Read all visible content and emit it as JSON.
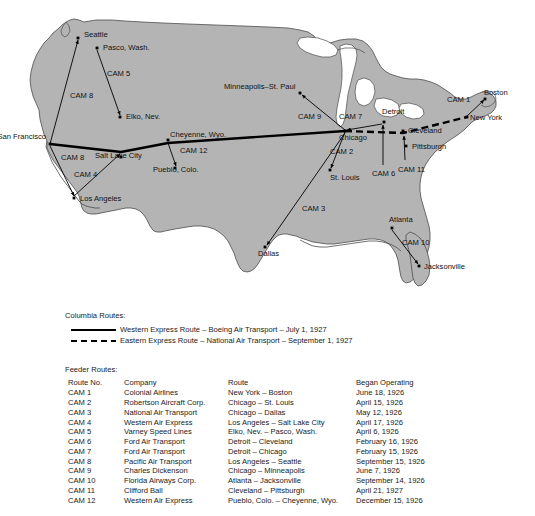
{
  "map": {
    "title": "U.S. Air Mail Routes Map",
    "land_color": "#b4b4b4",
    "water_color": "#ffffff",
    "outline_color": "#4d4d4d",
    "route_color": "#000000",
    "cities": [
      {
        "name": "Seattle",
        "x": 78,
        "y": 38,
        "lx": 84,
        "ly": 37,
        "anchor": "start"
      },
      {
        "name": "Pasco, Wash.",
        "x": 97,
        "y": 48,
        "lx": 103,
        "ly": 50,
        "anchor": "start"
      },
      {
        "name": "Elko, Nev.",
        "x": 120,
        "y": 117,
        "lx": 126,
        "ly": 119,
        "anchor": "start"
      },
      {
        "name": "San Francisco",
        "x": 50,
        "y": 144,
        "lx": 46,
        "ly": 139,
        "anchor": "end"
      },
      {
        "name": "Los Angeles",
        "x": 74,
        "y": 198,
        "lx": 80,
        "ly": 201,
        "anchor": "start"
      },
      {
        "name": "Salt Lake City",
        "x": 121,
        "y": 157,
        "lx": 95,
        "ly": 158,
        "anchor": "start"
      },
      {
        "name": "Cheyenne, Wyo.",
        "x": 168,
        "y": 140,
        "lx": 170,
        "ly": 137,
        "anchor": "start"
      },
      {
        "name": "Pueblo, Colo.",
        "x": 175,
        "y": 168,
        "lx": 153,
        "ly": 172,
        "anchor": "start"
      },
      {
        "name": "Minneapolis–St. Paul",
        "x": 300,
        "y": 93,
        "lx": 224,
        "ly": 89,
        "anchor": "start"
      },
      {
        "name": "Chicago",
        "x": 345,
        "y": 131,
        "lx": 339,
        "ly": 140,
        "anchor": "start"
      },
      {
        "name": "St. Louis",
        "x": 330,
        "y": 170,
        "lx": 330,
        "ly": 180,
        "anchor": "start"
      },
      {
        "name": "Detroit",
        "x": 384,
        "y": 122,
        "lx": 382,
        "ly": 114,
        "anchor": "start"
      },
      {
        "name": "Cleveland",
        "x": 403,
        "y": 131,
        "lx": 408,
        "ly": 133,
        "anchor": "start"
      },
      {
        "name": "Pittsburgh",
        "x": 406,
        "y": 146,
        "lx": 412,
        "ly": 149,
        "anchor": "start"
      },
      {
        "name": "New York",
        "x": 467,
        "y": 117,
        "lx": 470,
        "ly": 120,
        "anchor": "start"
      },
      {
        "name": "Boston",
        "x": 485,
        "y": 99,
        "lx": 484,
        "ly": 95,
        "anchor": "start"
      },
      {
        "name": "Dallas",
        "x": 265,
        "y": 247,
        "lx": 258,
        "ly": 256,
        "anchor": "start"
      },
      {
        "name": "Atlanta",
        "x": 392,
        "y": 228,
        "lx": 389,
        "ly": 222,
        "anchor": "start"
      },
      {
        "name": "Jacksonville",
        "x": 419,
        "y": 266,
        "lx": 424,
        "ly": 269,
        "anchor": "start"
      }
    ],
    "cam_labels": [
      {
        "name": "CAM 8",
        "x": 70,
        "y": 98
      },
      {
        "name": "CAM 5",
        "x": 107,
        "y": 76
      },
      {
        "name": "CAM 8",
        "x": 61,
        "y": 160
      },
      {
        "name": "CAM 4",
        "x": 74,
        "y": 177
      },
      {
        "name": "CAM 12",
        "x": 180,
        "y": 153
      },
      {
        "name": "CAM 9",
        "x": 298,
        "y": 119
      },
      {
        "name": "CAM 7",
        "x": 339,
        "y": 119
      },
      {
        "name": "CAM 2",
        "x": 330,
        "y": 154
      },
      {
        "name": "CAM 3",
        "x": 302,
        "y": 211
      },
      {
        "name": "CAM 6",
        "x": 372,
        "y": 176
      },
      {
        "name": "CAM 11",
        "x": 398,
        "y": 172
      },
      {
        "name": "CAM 1",
        "x": 447,
        "y": 102
      },
      {
        "name": "CAM 10",
        "x": 402,
        "y": 245
      }
    ]
  },
  "columbia_legend": {
    "title": "Columbia Routes:",
    "entries": [
      {
        "style": "solid",
        "label": "Western Express Route – Boeing Air Transport – July 1, 1927"
      },
      {
        "style": "dashed",
        "label": "Eastern Express Route – National Air Transport – September 1, 1927"
      }
    ]
  },
  "feeder_legend": {
    "title": "Feeder Routes:",
    "headers": {
      "route_no": "Route No.",
      "company": "Company",
      "route": "Route",
      "began": "Began Operating"
    },
    "rows": [
      {
        "no": "CAM 1",
        "company": "Colonial Airlines",
        "route": "New York – Boston",
        "began": "June 18, 1926"
      },
      {
        "no": "CAM 2",
        "company": "Robertson Aircraft Corp.",
        "route": "Chicago – St. Louis",
        "began": "April 15, 1926"
      },
      {
        "no": "CAM 3",
        "company": "National Air Transport",
        "route": "Chicago – Dallas",
        "began": "May 12, 1926"
      },
      {
        "no": "CAM 4",
        "company": "Western Air Express",
        "route": "Los Angeles – Salt Lake City",
        "began": "April 17, 1926"
      },
      {
        "no": "CAM 5",
        "company": "Varney Speed Lines",
        "route": "Elko, Nev. – Pasco, Wash.",
        "began": "April 6, 1926"
      },
      {
        "no": "CAM 6",
        "company": "Ford Air Transport",
        "route": "Detroit – Cleveland",
        "began": "February 16, 1926"
      },
      {
        "no": "CAM 7",
        "company": "Ford Air Transport",
        "route": "Detroit – Chicago",
        "began": "February 15, 1926"
      },
      {
        "no": "CAM 8",
        "company": "Pacific Air Transport",
        "route": "Los Angeles – Seattle",
        "began": "September 15, 1926"
      },
      {
        "no": "CAM 9",
        "company": "Charles Dickenson",
        "route": "Chicago – Minneapolis",
        "began": "June 7, 1926"
      },
      {
        "no": "CAM 10",
        "company": "Florida Airways Corp.",
        "route": "Atlanta – Jacksonville",
        "began": "September 14, 1926"
      },
      {
        "no": "CAM 11",
        "company": "Clifford Ball",
        "route": "Cleveland – Pittsburgh",
        "began": "April 21, 1927"
      },
      {
        "no": "CAM 12",
        "company": "Western Air Express",
        "route": "Pueblo, Colo. – Cheyenne, Wyo.",
        "began": "December 15, 1926"
      }
    ]
  }
}
